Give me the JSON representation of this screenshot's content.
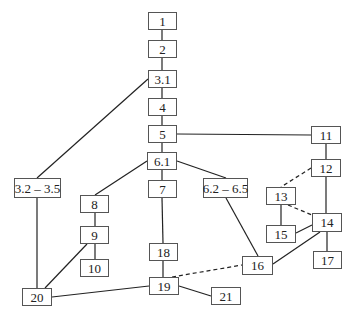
{
  "diagram": {
    "type": "dependency-graph",
    "colors": {
      "line": "#222222",
      "border": "#555555",
      "text": "#222222",
      "background": "#ffffff"
    },
    "nodes": [
      {
        "id": "1",
        "label": "1",
        "x": 148,
        "y": 12,
        "w": 29,
        "h": 18
      },
      {
        "id": "2",
        "label": "2",
        "x": 148,
        "y": 40,
        "w": 29,
        "h": 18
      },
      {
        "id": "3.1",
        "label": "3.1",
        "x": 148,
        "y": 70,
        "w": 29,
        "h": 18
      },
      {
        "id": "4",
        "label": "4",
        "x": 148,
        "y": 98,
        "w": 29,
        "h": 18
      },
      {
        "id": "5",
        "label": "5",
        "x": 148,
        "y": 125,
        "w": 29,
        "h": 18
      },
      {
        "id": "6.1",
        "label": "6.1",
        "x": 147,
        "y": 152,
        "w": 30,
        "h": 18
      },
      {
        "id": "7",
        "label": "7",
        "x": 148,
        "y": 180,
        "w": 29,
        "h": 18
      },
      {
        "id": "3.2-3.5",
        "label": "3.2 – 3.5",
        "x": 14,
        "y": 178,
        "w": 47,
        "h": 20
      },
      {
        "id": "6.2-6.5",
        "label": "6.2 – 6.5",
        "x": 203,
        "y": 178,
        "w": 45,
        "h": 20
      },
      {
        "id": "8",
        "label": "8",
        "x": 80,
        "y": 195,
        "w": 29,
        "h": 18
      },
      {
        "id": "9",
        "label": "9",
        "x": 80,
        "y": 226,
        "w": 29,
        "h": 18
      },
      {
        "id": "10",
        "label": "10",
        "x": 80,
        "y": 259,
        "w": 29,
        "h": 18
      },
      {
        "id": "11",
        "label": "11",
        "x": 311,
        "y": 126,
        "w": 30,
        "h": 18
      },
      {
        "id": "12",
        "label": "12",
        "x": 311,
        "y": 159,
        "w": 30,
        "h": 18
      },
      {
        "id": "13",
        "label": "13",
        "x": 266,
        "y": 187,
        "w": 30,
        "h": 18
      },
      {
        "id": "14",
        "label": "14",
        "x": 312,
        "y": 213,
        "w": 30,
        "h": 19
      },
      {
        "id": "15",
        "label": "15",
        "x": 266,
        "y": 225,
        "w": 30,
        "h": 18
      },
      {
        "id": "16",
        "label": "16",
        "x": 242,
        "y": 256,
        "w": 31,
        "h": 19
      },
      {
        "id": "17",
        "label": "17",
        "x": 313,
        "y": 251,
        "w": 29,
        "h": 18
      },
      {
        "id": "18",
        "label": "18",
        "x": 149,
        "y": 243,
        "w": 29,
        "h": 18
      },
      {
        "id": "19",
        "label": "19",
        "x": 149,
        "y": 277,
        "w": 30,
        "h": 18
      },
      {
        "id": "20",
        "label": "20",
        "x": 22,
        "y": 288,
        "w": 30,
        "h": 18
      },
      {
        "id": "21",
        "label": "21",
        "x": 211,
        "y": 287,
        "w": 30,
        "h": 18
      }
    ],
    "edges": [
      {
        "from": "1",
        "to": "2",
        "style": "solid",
        "x1": 162,
        "y1": 30,
        "x2": 162,
        "y2": 40
      },
      {
        "from": "2",
        "to": "3.1",
        "style": "solid",
        "x1": 162,
        "y1": 58,
        "x2": 162,
        "y2": 70
      },
      {
        "from": "3.1",
        "to": "4",
        "style": "solid",
        "x1": 162,
        "y1": 88,
        "x2": 162,
        "y2": 98
      },
      {
        "from": "4",
        "to": "5",
        "style": "solid",
        "x1": 162,
        "y1": 116,
        "x2": 162,
        "y2": 125
      },
      {
        "from": "5",
        "to": "6.1",
        "style": "solid",
        "x1": 162,
        "y1": 143,
        "x2": 162,
        "y2": 152
      },
      {
        "from": "6.1",
        "to": "7",
        "style": "solid",
        "x1": 162,
        "y1": 170,
        "x2": 162,
        "y2": 180
      },
      {
        "from": "3.1",
        "to": "3.2-3.5",
        "style": "solid",
        "x1": 148,
        "y1": 79,
        "x2": 37,
        "y2": 178
      },
      {
        "from": "5",
        "to": "11",
        "style": "solid",
        "x1": 177,
        "y1": 134,
        "x2": 311,
        "y2": 135
      },
      {
        "from": "6.1",
        "to": "8",
        "style": "solid",
        "x1": 147,
        "y1": 161,
        "x2": 95,
        "y2": 195
      },
      {
        "from": "6.1",
        "to": "6.2-6.5",
        "style": "solid",
        "x1": 177,
        "y1": 161,
        "x2": 226,
        "y2": 178
      },
      {
        "from": "7",
        "to": "18",
        "style": "solid",
        "x1": 162,
        "y1": 198,
        "x2": 163,
        "y2": 243
      },
      {
        "from": "8",
        "to": "9",
        "style": "solid",
        "x1": 95,
        "y1": 213,
        "x2": 95,
        "y2": 226
      },
      {
        "from": "9",
        "to": "10",
        "style": "solid",
        "x1": 95,
        "y1": 244,
        "x2": 95,
        "y2": 259
      },
      {
        "from": "9",
        "to": "20",
        "style": "solid",
        "x1": 87,
        "y1": 244,
        "x2": 45,
        "y2": 288
      },
      {
        "from": "3.2-3.5",
        "to": "20",
        "style": "solid",
        "x1": 37,
        "y1": 198,
        "x2": 37,
        "y2": 288
      },
      {
        "from": "20",
        "to": "19",
        "style": "solid",
        "x1": 52,
        "y1": 297,
        "x2": 149,
        "y2": 286
      },
      {
        "from": "18",
        "to": "19",
        "style": "solid",
        "x1": 163,
        "y1": 261,
        "x2": 163,
        "y2": 277
      },
      {
        "from": "19",
        "to": "21",
        "style": "solid",
        "x1": 179,
        "y1": 286,
        "x2": 211,
        "y2": 296
      },
      {
        "from": "19",
        "to": "16",
        "style": "dashed",
        "x1": 172,
        "y1": 277,
        "x2": 242,
        "y2": 265
      },
      {
        "from": "6.2-6.5",
        "to": "16",
        "style": "solid",
        "x1": 226,
        "y1": 198,
        "x2": 258,
        "y2": 256
      },
      {
        "from": "11",
        "to": "12",
        "style": "solid",
        "x1": 326,
        "y1": 144,
        "x2": 326,
        "y2": 159
      },
      {
        "from": "12",
        "to": "13",
        "style": "dashed",
        "x1": 311,
        "y1": 168,
        "x2": 281,
        "y2": 187
      },
      {
        "from": "12",
        "to": "14",
        "style": "solid",
        "x1": 326,
        "y1": 177,
        "x2": 326,
        "y2": 213
      },
      {
        "from": "13",
        "to": "14",
        "style": "dashed",
        "x1": 288,
        "y1": 205,
        "x2": 312,
        "y2": 215
      },
      {
        "from": "13",
        "to": "15",
        "style": "solid",
        "x1": 281,
        "y1": 205,
        "x2": 281,
        "y2": 225
      },
      {
        "from": "15",
        "to": "14",
        "style": "solid",
        "x1": 296,
        "y1": 233,
        "x2": 312,
        "y2": 225
      },
      {
        "from": "14",
        "to": "17",
        "style": "solid",
        "x1": 327,
        "y1": 232,
        "x2": 327,
        "y2": 251
      },
      {
        "from": "14",
        "to": "16",
        "style": "solid",
        "x1": 320,
        "y1": 232,
        "x2": 273,
        "y2": 264
      }
    ]
  }
}
